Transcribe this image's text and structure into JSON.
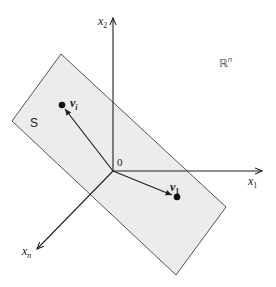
{
  "diagram": {
    "colors": {
      "plane_fill": "#ececec",
      "plane_stroke": "#555555",
      "axis": "#222222",
      "vector": "#222222",
      "point": "#111111"
    },
    "space_label": {
      "base": "ℝ",
      "sup": "n"
    },
    "subspace_label": "S",
    "origin_label": "0",
    "axes": [
      {
        "id": "x1",
        "base": "x",
        "sub": "1"
      },
      {
        "id": "x2",
        "base": "x",
        "sub": "2"
      },
      {
        "id": "xn",
        "base": "x",
        "sub": "n"
      }
    ],
    "vectors": [
      {
        "id": "v1",
        "base": "v",
        "sub": "1"
      },
      {
        "id": "vi",
        "base": "v",
        "sub": "i"
      }
    ]
  }
}
